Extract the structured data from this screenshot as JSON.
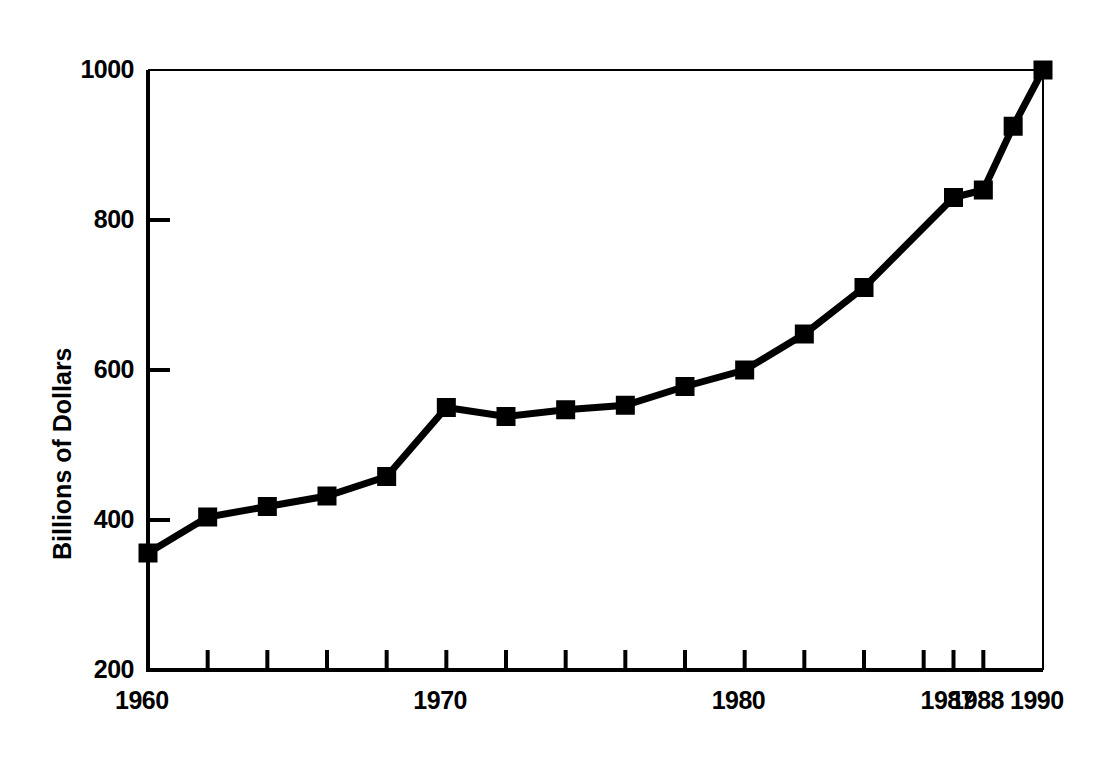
{
  "chart_data": {
    "type": "line",
    "title": "",
    "xlabel": "",
    "ylabel": "Billions of Dollars",
    "xlim": [
      1960,
      1990
    ],
    "ylim": [
      200,
      1000
    ],
    "grid": false,
    "legend": null,
    "marker": "square",
    "line_color": "#000000",
    "marker_color": "#000000",
    "y_ticks": [
      200,
      400,
      600,
      800,
      1000
    ],
    "y_tick_labels": [
      "200",
      "400",
      "600",
      "800",
      "1000"
    ],
    "x_ticks": [
      1960,
      1962,
      1964,
      1966,
      1968,
      1970,
      1972,
      1974,
      1976,
      1978,
      1980,
      1982,
      1984,
      1986,
      1987,
      1988,
      1990
    ],
    "x_tick_labels_shown": [
      "1960",
      "1970",
      "1980",
      "1987",
      "1988",
      "1990"
    ],
    "x": [
      1960,
      1962,
      1964,
      1966,
      1968,
      1970,
      1972,
      1974,
      1976,
      1978,
      1980,
      1982,
      1984,
      1987,
      1988,
      1989,
      1990
    ],
    "values": [
      356,
      404,
      418,
      432,
      458,
      550,
      538,
      547,
      553,
      578,
      600,
      648,
      710,
      830,
      840,
      925,
      1000
    ],
    "points": [
      {
        "x": 1960,
        "y": 356
      },
      {
        "x": 1962,
        "y": 404
      },
      {
        "x": 1964,
        "y": 418
      },
      {
        "x": 1966,
        "y": 432
      },
      {
        "x": 1968,
        "y": 458
      },
      {
        "x": 1970,
        "y": 550
      },
      {
        "x": 1972,
        "y": 538
      },
      {
        "x": 1974,
        "y": 547
      },
      {
        "x": 1976,
        "y": 553
      },
      {
        "x": 1978,
        "y": 578
      },
      {
        "x": 1980,
        "y": 600
      },
      {
        "x": 1982,
        "y": 648
      },
      {
        "x": 1984,
        "y": 710
      },
      {
        "x": 1987,
        "y": 830
      },
      {
        "x": 1988,
        "y": 840
      },
      {
        "x": 1989,
        "y": 925
      },
      {
        "x": 1990,
        "y": 1000
      }
    ]
  },
  "axis": {
    "y_title": "Billions of Dollars",
    "y_labels": [
      {
        "value": 1000,
        "text": "1000"
      },
      {
        "value": 800,
        "text": "800"
      },
      {
        "value": 600,
        "text": "600"
      },
      {
        "value": 400,
        "text": "400"
      },
      {
        "value": 200,
        "text": "200"
      }
    ],
    "x_labels": [
      {
        "value": 1960,
        "text": "1960"
      },
      {
        "value": 1970,
        "text": "1970"
      },
      {
        "value": 1980,
        "text": "1980"
      },
      {
        "value": 1987,
        "text": "1987"
      },
      {
        "value": 1988,
        "text": "1988"
      },
      {
        "value": 1990,
        "text": "1990"
      }
    ]
  },
  "style": {
    "background": "#ffffff",
    "ink": "#000000"
  }
}
